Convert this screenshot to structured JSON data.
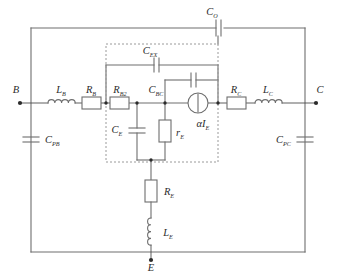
{
  "figure": {
    "type": "circuit-schematic",
    "background": "#ffffff",
    "wire_color": "#6e6e6e",
    "dashed_box_color": "#8a8a8a",
    "label_color": "#2b2b2b"
  },
  "terminals": {
    "base": "B",
    "collector": "C",
    "emitter": "E"
  },
  "components": {
    "c_o": {
      "label": "C",
      "sub": "O",
      "kind": "capacitor"
    },
    "c_ex": {
      "label": "C",
      "sub": "EX",
      "kind": "capacitor"
    },
    "c_bc": {
      "label": "C",
      "sub": "BC",
      "kind": "capacitor"
    },
    "c_e": {
      "label": "C",
      "sub": "E",
      "kind": "capacitor"
    },
    "c_pb": {
      "label": "C",
      "sub": "PB",
      "kind": "capacitor"
    },
    "c_pc": {
      "label": "C",
      "sub": "PC",
      "kind": "capacitor"
    },
    "l_b": {
      "label": "L",
      "sub": "B",
      "kind": "inductor"
    },
    "l_c": {
      "label": "L",
      "sub": "C",
      "kind": "inductor"
    },
    "l_e": {
      "label": "L",
      "sub": "E",
      "kind": "inductor"
    },
    "r_b": {
      "label": "R",
      "sub": "B",
      "kind": "resistor"
    },
    "r_b2": {
      "label": "R",
      "sub": "B2",
      "kind": "resistor"
    },
    "r_c": {
      "label": "R",
      "sub": "C",
      "kind": "resistor"
    },
    "r_e_big": {
      "label": "R",
      "sub": "E",
      "kind": "resistor"
    },
    "r_e_small": {
      "label": "r",
      "sub": "E",
      "kind": "resistor"
    },
    "source": {
      "label": "αI",
      "sub": "E",
      "kind": "current-source"
    }
  }
}
